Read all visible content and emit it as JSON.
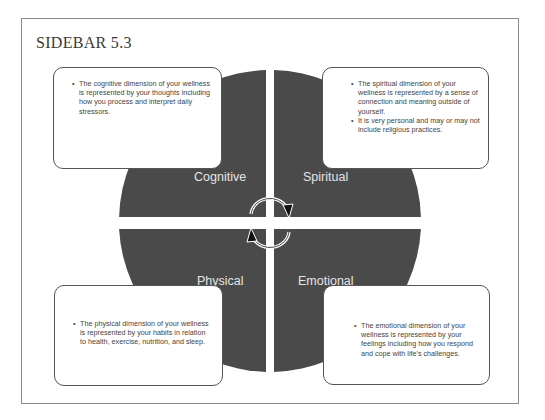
{
  "title": "SIDEBAR 5.3",
  "colors": {
    "quadrant_fill": "#4a4a4a",
    "frame_border": "#8a8a8a",
    "note_border": "#555555",
    "label_text": "#e4e4e4"
  },
  "quadrants": {
    "cognitive": {
      "label": "Cognitive"
    },
    "spiritual": {
      "label": "Spiritual"
    },
    "physical": {
      "label": "Physical"
    },
    "emotional": {
      "label": "Emotional"
    }
  },
  "notes": {
    "cognitive": {
      "bullets": [
        "The cognitive dimension of your wellness is represented by your thoughts including how you process and interpret daily stressors."
      ]
    },
    "spiritual": {
      "bullets": [
        "The spiritual dimension of your wellness is represented by a sense of connection and meaning outside of yourself.",
        "It is very personal and may or may not include religious practices."
      ]
    },
    "physical": {
      "bullets": [
        "The physical dimension of your wellness is represented by your habits in relation to health, exercise, nutrition, and sleep."
      ]
    },
    "emotional": {
      "bullets": [
        "The emotional dimension of your wellness is represented by your feelings including how you respond and cope with life's challenges."
      ]
    }
  },
  "icons": {
    "top_arrow": "clockwise-arrow-icon",
    "bottom_arrow": "clockwise-arrow-icon"
  }
}
